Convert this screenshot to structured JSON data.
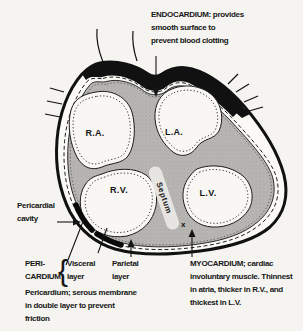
{
  "figure": {
    "title_implied": "Cross-section of the heart showing pericardial layers",
    "background_color": "#f5f4f1",
    "ink_color": "#161616",
    "myocardium_gray": "#b6b5b2",
    "septum_band_color": "#e6e5e2"
  },
  "chambers": {
    "right_atrium": "R.A.",
    "left_atrium": "L.A.",
    "right_ventricle": "R.V.",
    "left_ventricle": "L.V.",
    "septum": "Septum"
  },
  "annotations": {
    "endocardium": [
      "ENDOCARDIUM: provides",
      "smooth surface to",
      "prevent blood clotting"
    ],
    "pericardial_cavity": [
      "Pericardial",
      "cavity"
    ],
    "pericardium_word": [
      "PERI-",
      "CARDIUM"
    ],
    "brace": "{",
    "visceral": [
      "Visceral",
      "layer"
    ],
    "parietal": [
      "Parietal",
      "layer"
    ],
    "pericardium_note": [
      "Pericardium; serous membrane",
      "in double layer to prevent",
      "friction"
    ],
    "myocardium": [
      "MYOCARDIUM; cardiac",
      "involuntary muscle. Thinnest",
      "in atria, thicker in R.V., and",
      "thickest in L.V."
    ],
    "x_marker": "x"
  }
}
